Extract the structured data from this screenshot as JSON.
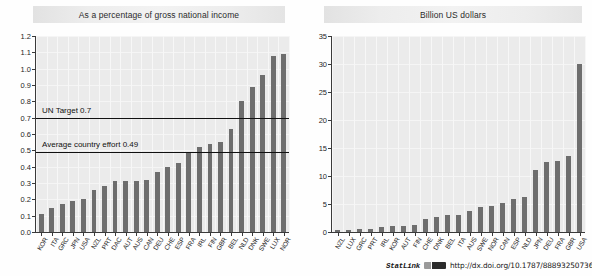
{
  "source": {
    "statlink_label": "StatLink",
    "url": "http://dx.doi.org/10.1787/888932507369",
    "glyph_icon": "statlink-glyph-icon"
  },
  "chart_data": [
    {
      "type": "bar",
      "panel": "left",
      "title": "As a percentage of gross national income",
      "xlabel": "",
      "ylabel": "",
      "ylim": [
        0.0,
        1.2
      ],
      "yticks": [
        "0.0",
        "0.1",
        "0.2",
        "0.3",
        "0.4",
        "0.5",
        "0.6",
        "0.7",
        "0.8",
        "0.9",
        "1.0",
        "1.1",
        "1.2"
      ],
      "grid": true,
      "legend": "none",
      "bar_color": "#6e6e6e",
      "categories": [
        "KOR",
        "ITA",
        "GRC",
        "JPN",
        "USA",
        "NZL",
        "PRT",
        "DAC",
        "AUT",
        "AUS",
        "CAN",
        "DEU",
        "CHE",
        "ESP",
        "FRA",
        "IRL",
        "FIN",
        "GBR",
        "BEL",
        "NLD",
        "DNK",
        "SWE",
        "LUX",
        "NOR"
      ],
      "values": [
        0.11,
        0.15,
        0.17,
        0.19,
        0.2,
        0.26,
        0.28,
        0.31,
        0.31,
        0.31,
        0.32,
        0.37,
        0.4,
        0.42,
        0.49,
        0.52,
        0.54,
        0.55,
        0.63,
        0.8,
        0.89,
        0.96,
        1.08,
        1.09
      ],
      "annotations": [
        {
          "name": "un-target-line",
          "label": "UN Target 0.7",
          "value": 0.7
        },
        {
          "name": "average-effort-line",
          "label": "Average country effort 0.49",
          "value": 0.49
        }
      ]
    },
    {
      "type": "bar",
      "panel": "right",
      "title": "Billion US dollars",
      "xlabel": "",
      "ylabel": "",
      "ylim": [
        0,
        35
      ],
      "yticks": [
        "0",
        "5",
        "10",
        "15",
        "20",
        "25",
        "30",
        "35"
      ],
      "grid": true,
      "legend": "none",
      "bar_color": "#6e6e6e",
      "categories": [
        "NZL",
        "LUX",
        "GRC",
        "PRT",
        "IRL",
        "KOR",
        "AUT",
        "FIN",
        "CHE",
        "DNK",
        "BEL",
        "ITA",
        "AUS",
        "SWE",
        "NOR",
        "CAN",
        "ESP",
        "NLD",
        "JPN",
        "DEU",
        "FRA",
        "GBR",
        "USA"
      ],
      "values": [
        0.3,
        0.4,
        0.5,
        0.6,
        0.9,
        1.0,
        1.1,
        1.3,
        2.3,
        2.7,
        3.0,
        3.0,
        3.8,
        4.5,
        4.6,
        5.1,
        5.9,
        6.3,
        11.0,
        12.5,
        12.7,
        13.5,
        30.0
      ],
      "annotations": []
    }
  ]
}
